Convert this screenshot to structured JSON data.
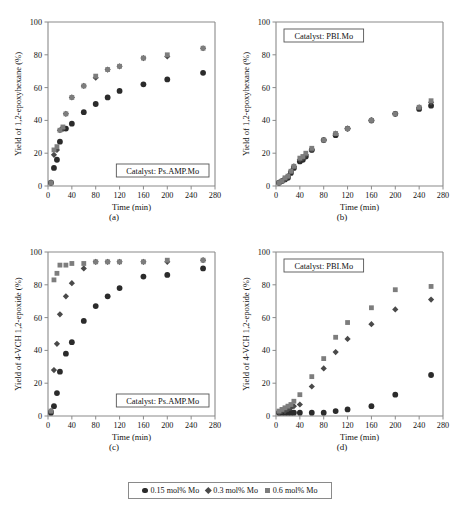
{
  "legend": {
    "items": [
      {
        "label": "0.15 mol% Mo",
        "marker": "circle",
        "color": "#2b2b2b"
      },
      {
        "label": "0.3 mol% Mo",
        "marker": "diamond",
        "color": "#4a4a4a"
      },
      {
        "label": "0.6 mol% Mo",
        "marker": "square",
        "color": "#7d7d7d"
      }
    ]
  },
  "panel_labels": {
    "a": "(a)",
    "b": "(b)",
    "c": "(c)",
    "d": "(d)"
  },
  "caption": "",
  "chart_data": [
    {
      "id": "a",
      "type": "scatter",
      "panel_label": "(a)",
      "title": "",
      "annotation": "Catalyst: Ps.AMP.Mo",
      "xlabel": "Time (min)",
      "ylabel": "Yield of 1,2-epoxyhexane (%)",
      "xlim": [
        0,
        280
      ],
      "ylim": [
        0,
        100
      ],
      "xticks": [
        0,
        40,
        80,
        120,
        160,
        200,
        240,
        280
      ],
      "yticks": [
        0,
        20,
        40,
        60,
        80,
        100
      ],
      "grid": false,
      "legend_position": "figure-bottom",
      "series": [
        {
          "name": "0.15 mol% Mo",
          "marker": "circle",
          "color": "#2b2b2b",
          "x": [
            5,
            10,
            15,
            20,
            25,
            30,
            40,
            60,
            80,
            100,
            120,
            160,
            200,
            260
          ],
          "y": [
            2,
            11,
            16,
            27,
            35,
            35,
            38,
            45,
            50,
            54,
            58,
            62,
            65,
            69
          ]
        },
        {
          "name": "0.3 mol% Mo",
          "marker": "diamond",
          "color": "#4a4a4a",
          "x": [
            5,
            10,
            15,
            20,
            25,
            30,
            40,
            60,
            80,
            100,
            120,
            160,
            200,
            260
          ],
          "y": [
            2,
            19,
            22,
            34,
            35,
            44,
            54,
            61,
            66,
            71,
            73,
            78,
            79,
            84
          ]
        },
        {
          "name": "0.6 mol% Mo",
          "marker": "square",
          "color": "#7d7d7d",
          "x": [
            5,
            10,
            15,
            20,
            25,
            30,
            40,
            60,
            80,
            100,
            120,
            160,
            200,
            260
          ],
          "y": [
            2,
            22,
            24,
            34,
            36,
            44,
            54,
            61,
            67,
            71,
            73,
            78,
            80,
            84
          ]
        }
      ]
    },
    {
      "id": "b",
      "type": "scatter",
      "panel_label": "(b)",
      "title": "",
      "annotation": "Catalyst: PBI.Mo",
      "xlabel": "Time (min)",
      "ylabel": "Yield of 1,2-epoxyhexane (%)",
      "xlim": [
        0,
        280
      ],
      "ylim": [
        0,
        100
      ],
      "xticks": [
        0,
        40,
        80,
        120,
        160,
        200,
        240,
        280
      ],
      "yticks": [
        0,
        20,
        40,
        60,
        80,
        100
      ],
      "grid": false,
      "legend_position": "figure-bottom",
      "series": [
        {
          "name": "0.15 mol% Mo",
          "marker": "circle",
          "color": "#2b2b2b",
          "x": [
            5,
            10,
            15,
            20,
            25,
            30,
            40,
            45,
            50,
            60,
            80,
            100,
            120,
            160,
            200,
            240,
            260
          ],
          "y": [
            2,
            3,
            4,
            5,
            8,
            11,
            15,
            16,
            18,
            22,
            28,
            31,
            35,
            40,
            44,
            47,
            49
          ]
        },
        {
          "name": "0.3 mol% Mo",
          "marker": "diamond",
          "color": "#4a4a4a",
          "x": [
            5,
            10,
            15,
            20,
            25,
            30,
            40,
            45,
            50,
            60,
            80,
            100,
            120,
            160,
            200,
            240,
            260
          ],
          "y": [
            2,
            3,
            4,
            6,
            9,
            12,
            16,
            17,
            19,
            22,
            28,
            32,
            35,
            40,
            44,
            48,
            51
          ]
        },
        {
          "name": "0.6 mol% Mo",
          "marker": "square",
          "color": "#7d7d7d",
          "x": [
            5,
            10,
            15,
            20,
            25,
            30,
            40,
            45,
            50,
            60,
            80,
            100,
            120,
            160,
            200,
            240,
            260
          ],
          "y": [
            2,
            3,
            5,
            6,
            9,
            12,
            17,
            18,
            20,
            23,
            28,
            32,
            35,
            40,
            44,
            48,
            52
          ]
        }
      ]
    },
    {
      "id": "c",
      "type": "scatter",
      "panel_label": "(c)",
      "title": "",
      "annotation": "Catalyst: Ps.AMP.Mo",
      "xlabel": "Time (min)",
      "ylabel": "Yield of 4-VCH 1,2-epoxide (%)",
      "xlim": [
        0,
        280
      ],
      "ylim": [
        0,
        100
      ],
      "xticks": [
        0,
        40,
        80,
        120,
        160,
        200,
        240,
        280
      ],
      "yticks": [
        0,
        20,
        40,
        60,
        80,
        100
      ],
      "grid": false,
      "legend_position": "figure-bottom",
      "series": [
        {
          "name": "0.15 mol% Mo",
          "marker": "circle",
          "color": "#2b2b2b",
          "x": [
            5,
            10,
            15,
            20,
            30,
            40,
            60,
            80,
            100,
            120,
            160,
            200,
            260
          ],
          "y": [
            2,
            6,
            14,
            27,
            38,
            45,
            58,
            67,
            73,
            78,
            85,
            86,
            90
          ]
        },
        {
          "name": "0.3 mol% Mo",
          "marker": "diamond",
          "color": "#4a4a4a",
          "x": [
            5,
            10,
            15,
            20,
            30,
            40,
            60,
            80,
            100,
            120,
            160,
            200,
            260
          ],
          "y": [
            3,
            28,
            44,
            62,
            73,
            81,
            90,
            94,
            94,
            94,
            94,
            94,
            95
          ]
        },
        {
          "name": "0.6 mol% Mo",
          "marker": "square",
          "color": "#7d7d7d",
          "x": [
            5,
            10,
            15,
            20,
            30,
            40,
            60,
            80,
            100,
            120,
            160,
            200,
            260
          ],
          "y": [
            3,
            83,
            87,
            92,
            92,
            93,
            93,
            94,
            94,
            94,
            94,
            95,
            95
          ]
        }
      ]
    },
    {
      "id": "d",
      "type": "scatter",
      "panel_label": "(d)",
      "title": "",
      "annotation": "Catalyst: PBI.Mo",
      "xlabel": "Time (min)",
      "ylabel": "Yield of 4-VCH 1,2-epoxide (%)",
      "xlim": [
        0,
        280
      ],
      "ylim": [
        0,
        100
      ],
      "xticks": [
        0,
        40,
        80,
        120,
        160,
        200,
        240,
        280
      ],
      "yticks": [
        0,
        20,
        40,
        60,
        80,
        100
      ],
      "grid": false,
      "legend_position": "figure-bottom",
      "series": [
        {
          "name": "0.15 mol% Mo",
          "marker": "circle",
          "color": "#2b2b2b",
          "x": [
            5,
            10,
            15,
            20,
            25,
            30,
            40,
            60,
            80,
            100,
            120,
            160,
            200,
            260
          ],
          "y": [
            2,
            2,
            2,
            2,
            2,
            2,
            2,
            2,
            2,
            3,
            4,
            6,
            13,
            25
          ]
        },
        {
          "name": "0.3 mol% Mo",
          "marker": "diamond",
          "color": "#4a4a4a",
          "x": [
            5,
            10,
            15,
            20,
            25,
            30,
            40,
            60,
            80,
            100,
            120,
            160,
            200,
            260
          ],
          "y": [
            2,
            3,
            3,
            4,
            5,
            6,
            7,
            18,
            29,
            39,
            47,
            56,
            65,
            71
          ]
        },
        {
          "name": "0.6 mol% Mo",
          "marker": "square",
          "color": "#7d7d7d",
          "x": [
            5,
            10,
            15,
            20,
            25,
            30,
            40,
            60,
            80,
            100,
            120,
            160,
            200,
            260
          ],
          "y": [
            3,
            4,
            5,
            6,
            7,
            9,
            13,
            24,
            35,
            48,
            57,
            66,
            77,
            79
          ]
        }
      ]
    }
  ]
}
